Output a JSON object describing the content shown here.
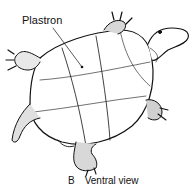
{
  "figure": {
    "labels": [
      {
        "id": "plastron",
        "text": "Plastron"
      }
    ],
    "caption": {
      "letter": "B",
      "text": "Ventral view"
    }
  }
}
